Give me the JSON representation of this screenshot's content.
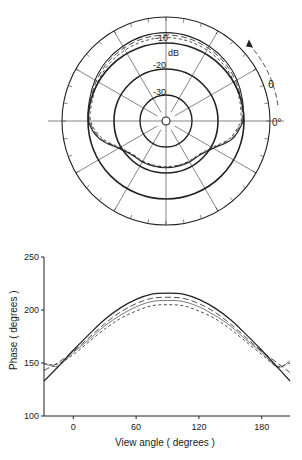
{
  "chart_data": [
    {
      "type": "polar",
      "title": "",
      "radial_unit_label": "dB",
      "radial_ticks": [
        "-10",
        "-20",
        "-30"
      ],
      "angle_label": "θ",
      "angle_zero_label": "0°",
      "angle_direction": "counter-clockwise",
      "radial_range_db": [
        -40,
        0
      ],
      "spoke_step_deg": 30,
      "minor_tick_step_deg": 10,
      "series": [
        {
          "name": "solid",
          "style": "solid",
          "angles_deg": [
            0,
            15,
            30,
            45,
            60,
            75,
            90,
            105,
            120,
            135,
            150,
            165,
            180,
            195,
            210,
            225,
            240,
            255,
            270,
            285,
            300,
            315,
            330,
            345,
            360
          ],
          "values_db": [
            -10.2,
            -9.5,
            -8.5,
            -7.5,
            -6.8,
            -6.2,
            -6.0,
            -6.2,
            -6.8,
            -7.5,
            -8.5,
            -9.5,
            -10.2,
            -13.5,
            -19.0,
            -21.5,
            -21.8,
            -22.0,
            -22.0,
            -22.0,
            -21.8,
            -21.5,
            -19.0,
            -13.5,
            -10.2
          ]
        },
        {
          "name": "long-dash",
          "style": "long-dash",
          "angles_deg": [
            0,
            15,
            30,
            45,
            60,
            75,
            90,
            105,
            120,
            135,
            150,
            165,
            180,
            195,
            210,
            225,
            240,
            255,
            270,
            285,
            300,
            315,
            330,
            345,
            360
          ],
          "values_db": [
            -10.6,
            -10.0,
            -9.1,
            -8.2,
            -7.6,
            -7.1,
            -6.9,
            -7.1,
            -7.6,
            -8.2,
            -9.1,
            -10.0,
            -10.6,
            -14.0,
            -19.3,
            -21.7,
            -22.0,
            -22.2,
            -22.2,
            -22.2,
            -22.0,
            -21.7,
            -19.3,
            -14.0,
            -10.6
          ]
        },
        {
          "name": "short-dash",
          "style": "short-dash",
          "angles_deg": [
            0,
            15,
            30,
            45,
            60,
            75,
            90,
            105,
            120,
            135,
            150,
            165,
            180,
            195,
            210,
            225,
            240,
            255,
            270,
            285,
            300,
            315,
            330,
            345,
            360
          ],
          "values_db": [
            -11.0,
            -10.6,
            -9.8,
            -9.0,
            -8.5,
            -8.1,
            -7.9,
            -8.1,
            -8.5,
            -9.0,
            -9.8,
            -10.6,
            -11.0,
            -14.5,
            -19.6,
            -21.9,
            -22.2,
            -22.4,
            -22.4,
            -22.4,
            -22.2,
            -21.9,
            -19.6,
            -14.5,
            -11.0
          ]
        }
      ]
    },
    {
      "type": "line",
      "title": "",
      "xlabel": "View angle ( degrees )",
      "ylabel": "Phase ( degrees )",
      "xlim": [
        -28,
        207
      ],
      "ylim": [
        100,
        250
      ],
      "xticks": [
        0,
        60,
        120,
        180
      ],
      "yticks": [
        100,
        150,
        200,
        250
      ],
      "grid": false,
      "legend": "none",
      "x": [
        -28,
        -15,
        0,
        15,
        30,
        45,
        60,
        75,
        90,
        105,
        120,
        135,
        150,
        165,
        180,
        195,
        207
      ],
      "series": [
        {
          "name": "solid",
          "style": "solid",
          "values": [
            133,
            146,
            162,
            177,
            191,
            202,
            210,
            215,
            216,
            215,
            210,
            202,
            191,
            177,
            162,
            146,
            133
          ]
        },
        {
          "name": "long-dash",
          "style": "long-dash",
          "values": [
            143,
            150,
            161,
            174,
            187,
            198,
            206,
            211,
            212,
            211,
            206,
            198,
            187,
            174,
            161,
            150,
            141
          ]
        },
        {
          "name": "short-dash",
          "style": "short-dash",
          "values": [
            149,
            149,
            158,
            170,
            182,
            192,
            199,
            204,
            205,
            204,
            199,
            192,
            182,
            170,
            158,
            147,
            150
          ]
        },
        {
          "name": "thin-solid",
          "style": "thin",
          "values": [
            150,
            147,
            160,
            172,
            185,
            195,
            203,
            208,
            209,
            208,
            203,
            195,
            185,
            172,
            160,
            146,
            152
          ]
        }
      ]
    }
  ]
}
